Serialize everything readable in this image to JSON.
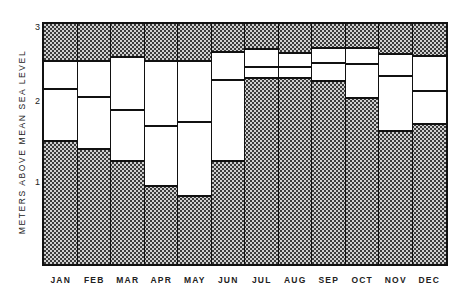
{
  "chart_data": {
    "type": "bar",
    "subtype": "floating-range-bars",
    "title": "",
    "xlabel": "",
    "ylabel": "METERS ABOVE MEAN SEA LEVEL",
    "ylim": [
      0,
      3.08
    ],
    "yticks": [
      1,
      2,
      3
    ],
    "grid": false,
    "legend": null,
    "categories": [
      "JAN",
      "FEB",
      "MAR",
      "APR",
      "MAY",
      "JUN",
      "JUL",
      "AUG",
      "SEP",
      "OCT",
      "NOV",
      "DEC"
    ],
    "series": [
      {
        "name": "upper",
        "values": [
          2.62,
          2.62,
          2.67,
          2.62,
          2.62,
          2.73,
          2.77,
          2.72,
          2.78,
          2.78,
          2.71,
          2.68
        ]
      },
      {
        "name": "middle",
        "values": [
          2.26,
          2.15,
          1.99,
          1.78,
          1.83,
          2.38,
          2.54,
          2.54,
          2.59,
          2.58,
          2.42,
          2.23
        ]
      },
      {
        "name": "lower",
        "values": [
          1.56,
          1.46,
          1.31,
          0.99,
          0.86,
          1.31,
          2.37,
          2.37,
          2.33,
          2.12,
          1.69,
          1.79
        ]
      }
    ],
    "annotations": "Hatched regions above upper and below lower bounds; white band between lower and upper with a horizontal line at the middle value."
  },
  "axis": {
    "ylabel": "METERS ABOVE MEAN SEA LEVEL",
    "yticks": [
      "1",
      "2",
      "3"
    ],
    "months": [
      "JAN",
      "FEB",
      "MAR",
      "APR",
      "MAY",
      "JUN",
      "JUL",
      "AUG",
      "SEP",
      "OCT",
      "NOV",
      "DEC"
    ]
  },
  "colors": {
    "hatch_dark": "#3a3a3a",
    "hatch_light": "#cfcfcf",
    "band": "#ffffff",
    "line": "#111111"
  }
}
